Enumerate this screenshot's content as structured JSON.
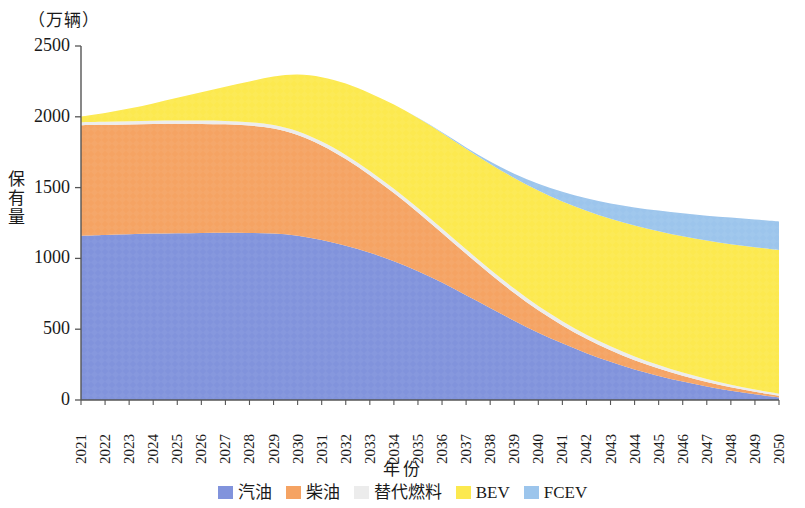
{
  "chart_data": {
    "type": "area",
    "title": "",
    "unit_label": "（万辆）",
    "xlabel": "年份",
    "ylabel": "保有量",
    "ylim": [
      0,
      2500
    ],
    "yticks": [
      0,
      500,
      1000,
      1500,
      2000,
      2500
    ],
    "grid": false,
    "legend_position": "bottom",
    "stacked": true,
    "categories": [
      "2021",
      "2022",
      "2023",
      "2024",
      "2025",
      "2026",
      "2027",
      "2028",
      "2029",
      "2030",
      "2031",
      "2032",
      "2033",
      "2034",
      "2035",
      "2036",
      "2037",
      "2038",
      "2039",
      "2040",
      "2041",
      "2042",
      "2043",
      "2044",
      "2045",
      "2046",
      "2047",
      "2048",
      "2049",
      "2050"
    ],
    "series": [
      {
        "name": "汽油",
        "color": "#8193dc",
        "values": [
          1160,
          1165,
          1170,
          1175,
          1178,
          1180,
          1182,
          1180,
          1175,
          1160,
          1130,
          1090,
          1040,
          980,
          910,
          830,
          740,
          650,
          560,
          475,
          400,
          330,
          270,
          215,
          170,
          130,
          95,
          65,
          40,
          18
        ]
      },
      {
        "name": "柴油",
        "color": "#f5a363",
        "values": [
          780,
          778,
          776,
          775,
          773,
          770,
          765,
          758,
          742,
          712,
          668,
          612,
          548,
          482,
          415,
          350,
          292,
          240,
          196,
          158,
          127,
          102,
          82,
          66,
          53,
          42,
          33,
          25,
          18,
          12
        ]
      },
      {
        "name": "替代燃料",
        "color": "#ececec",
        "values": [
          22,
          22,
          22,
          22,
          23,
          23,
          24,
          24,
          25,
          26,
          27,
          28,
          29,
          30,
          31,
          31,
          32,
          32,
          32,
          31,
          30,
          29,
          28,
          26,
          24,
          22,
          20,
          18,
          16,
          14
        ]
      },
      {
        "name": "BEV",
        "color": "#fce94f",
        "values": [
          40,
          62,
          90,
          122,
          160,
          200,
          242,
          288,
          342,
          400,
          455,
          505,
          550,
          595,
          635,
          675,
          710,
          745,
          780,
          815,
          845,
          875,
          900,
          925,
          945,
          962,
          978,
          992,
          1005,
          1015
        ]
      },
      {
        "name": "FCEV",
        "color": "#9cc5ec",
        "values": [
          0,
          0,
          0,
          0,
          0,
          0,
          0,
          0,
          0,
          0,
          0,
          0,
          0,
          0,
          2,
          5,
          10,
          18,
          30,
          48,
          68,
          88,
          108,
          128,
          146,
          162,
          176,
          188,
          196,
          202
        ]
      }
    ],
    "totals": [
      2002,
      2027,
      2058,
      2094,
      2134,
      2173,
      2213,
      2250,
      2284,
      2298,
      2280,
      2235,
      2167,
      2087,
      1993,
      1891,
      1784,
      1685,
      1598,
      1527,
      1470,
      1424,
      1388,
      1360,
      1338,
      1318,
      1302,
      1288,
      1275,
      1261
    ]
  },
  "legend": {
    "items": [
      {
        "label": "汽油",
        "color": "#8193dc"
      },
      {
        "label": "柴油",
        "color": "#f5a363"
      },
      {
        "label": "替代燃料",
        "color": "#ececec"
      },
      {
        "label": "BEV",
        "color": "#fce94f"
      },
      {
        "label": "FCEV",
        "color": "#9cc5ec"
      }
    ]
  }
}
